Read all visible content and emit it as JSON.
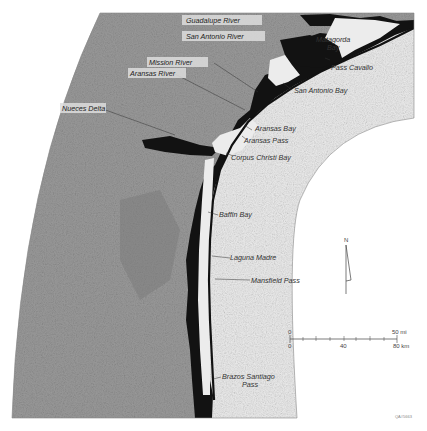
{
  "map": {
    "labels": {
      "guadalupe_river": "Guadalupe River",
      "san_antonio_river": "San Antonio River",
      "mission_river": "Mission River",
      "aransas_river": "Aransas River",
      "nueces_delta": "Nueces Delta",
      "matagorda_bay_1": "Matagorda",
      "matagorda_bay_2": "Bay",
      "pass_cavallo": "Pass Cavallo",
      "san_antonio_bay": "San Antonio Bay",
      "aransas_bay": "Aransas Bay",
      "aransas_pass": "Aransas Pass",
      "corpus_christi_bay": "Corpus Christi Bay",
      "baffin_bay": "Baffin Bay",
      "laguna_madre": "Laguna Madre",
      "mansfield_pass": "Mansfield Pass",
      "brazos_santiago_1": "Brazos Santiago",
      "brazos_santiago_2": "Pass"
    },
    "north_arrow": {
      "label": "N"
    },
    "scale_bar": {
      "mi_start": "0",
      "mi_end": "50 mi",
      "km_start": "0",
      "km_mid": "40",
      "km_end": "80 km"
    },
    "credit": "QA#5663",
    "colors": {
      "land": "#9a9a9a",
      "marsh": "#111111",
      "water": "#ececec",
      "background": "#ffffff"
    }
  }
}
